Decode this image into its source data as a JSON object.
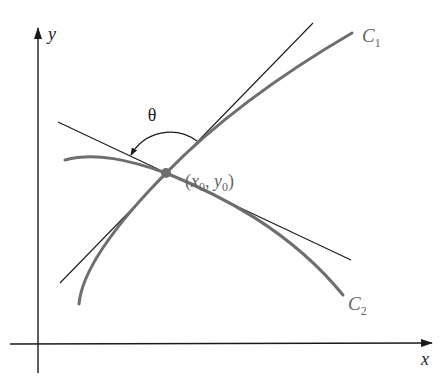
{
  "diagram": {
    "axes": {
      "x_label": "x",
      "y_label": "y"
    },
    "curves": [
      {
        "name": "C1",
        "label_main": "C",
        "label_sub": "1"
      },
      {
        "name": "C2",
        "label_main": "C",
        "label_sub": "2"
      }
    ],
    "tangent_lines": [
      {
        "name": "tangent-to-C1"
      },
      {
        "name": "tangent-to-C2"
      }
    ],
    "intersection_point": {
      "label_open": "(",
      "x_main": "x",
      "x_sub": "0",
      "sep": ", ",
      "y_main": "y",
      "y_sub": "0",
      "label_close": ")"
    },
    "angle": {
      "symbol": "θ"
    },
    "colors": {
      "axes": "#1a1a1a",
      "tangent_lines": "#1a1a1a",
      "curves": "#6e6e6e",
      "point": "#6e6e6e",
      "label_gray": "#666666"
    }
  }
}
